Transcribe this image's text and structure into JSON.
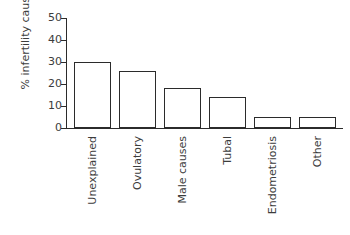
{
  "chart_data": {
    "type": "bar",
    "title": "",
    "xlabel": "",
    "ylabel": "% infertility causes",
    "categories": [
      "Unexplained",
      "Ovulatory",
      "Male causes",
      "Tubal",
      "Endometriosis",
      "Other"
    ],
    "values": [
      30,
      26,
      18,
      14,
      5,
      5
    ],
    "ylim": [
      0,
      50
    ],
    "yticks": [
      0,
      10,
      20,
      30,
      40,
      50
    ],
    "ytick_labels": [
      "0",
      "10",
      "20",
      "30",
      "40",
      "50"
    ],
    "grid": false,
    "legend": null,
    "bar_fill_color": "#ffffff",
    "bar_edge_color": "#2b2b2b",
    "text_color": "#3c3c3c",
    "background_color": "#ffffff"
  }
}
